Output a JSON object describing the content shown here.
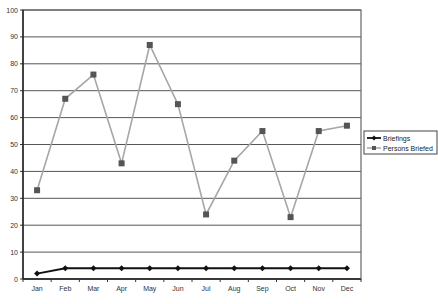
{
  "chart_data": {
    "type": "line",
    "title": "",
    "xlabel": "",
    "ylabel": "",
    "categories": [
      "Jan",
      "Feb",
      "Mar",
      "Apr",
      "May",
      "Jun",
      "Jul",
      "Aug",
      "Sep",
      "Oct",
      "Nov",
      "Dec"
    ],
    "ylim": [
      0,
      100
    ],
    "yticks": [
      0,
      10,
      20,
      30,
      40,
      50,
      60,
      70,
      80,
      90,
      100
    ],
    "grid": true,
    "legend_position": "right",
    "series": [
      {
        "name": "Briefings",
        "marker": "diamond",
        "color": "#111111",
        "values": [
          2,
          4,
          4,
          4,
          4,
          4,
          4,
          4,
          4,
          4,
          4,
          4
        ]
      },
      {
        "name": "Persons Briefed",
        "marker": "square",
        "color": "#a6a6a6",
        "marker_color": "#555555",
        "values": [
          33,
          67,
          76,
          43,
          87,
          65,
          24,
          44,
          55,
          23,
          55,
          57
        ]
      }
    ]
  }
}
